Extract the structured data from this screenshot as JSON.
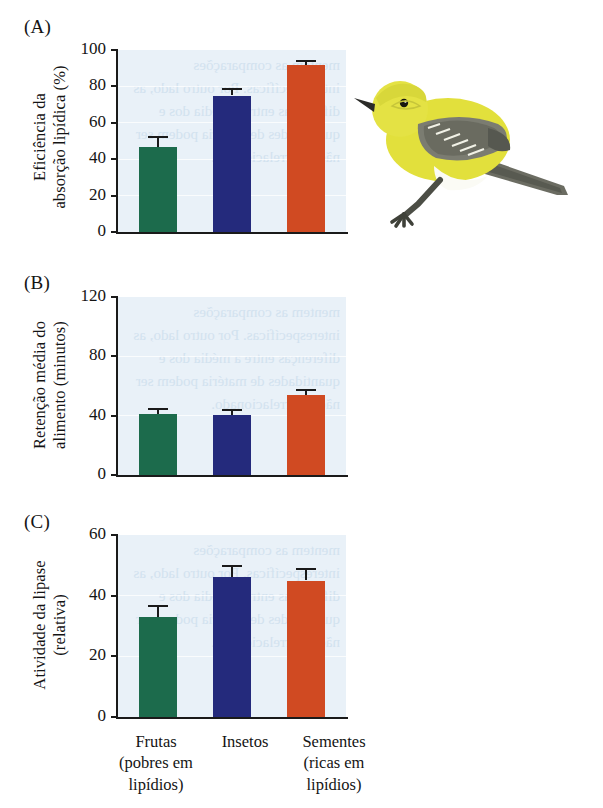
{
  "figure": {
    "panels": [
      {
        "letter": "(A)",
        "ylabel": "Eficiência da\nabsorção lipídica (%)",
        "yticks": [
          "0",
          "20",
          "40",
          "60",
          "80",
          "100"
        ],
        "ymax": 100
      },
      {
        "letter": "(B)",
        "ylabel": "Retenção média do\nalimento (minutos)",
        "yticks": [
          "0",
          "40",
          "80",
          "120"
        ],
        "ymax": 120
      },
      {
        "letter": "(C)",
        "ylabel": "Atividade da lipase\n(relativa)",
        "yticks": [
          "0",
          "20",
          "40",
          "60"
        ],
        "ymax": 60
      }
    ],
    "categories": [
      "Frutas\n(pobres em\nlipídios)",
      "Insetos",
      "Sementes\n(ricas em\nlipídios)"
    ],
    "colors": {
      "green": "#1c6b4c",
      "blue": "#242a7c",
      "orange": "#d04a22",
      "plot_background": "#e9f1f8",
      "axis": "#1a1a1a"
    },
    "illustration": {
      "name": "yellow-warbler-bird",
      "body_color": "#e4e23a",
      "wing_color": "#6f7066",
      "belly_color": "#fbfbf6",
      "beak_color": "#2b2b28"
    },
    "showthrough_text": "mentem as comparações interespecíficas. Por outro lado, as diferenças entre a média dos e quantidades de matéria podem ser não é correlacionado."
  },
  "chart_data": [
    {
      "type": "bar",
      "title": "(A)",
      "categories": [
        "Frutas (pobres em lipídios)",
        "Insetos",
        "Sementes (ricas em lipídios)"
      ],
      "values": [
        46.5,
        75,
        91.5
      ],
      "errors": [
        6,
        4,
        3
      ],
      "xlabel": "",
      "ylabel": "Eficiência da absorção lipídica (%)",
      "ylim": [
        0,
        100
      ],
      "yticks": [
        0,
        20,
        40,
        60,
        80,
        100
      ],
      "grid": true,
      "legend": "none"
    },
    {
      "type": "bar",
      "title": "(B)",
      "categories": [
        "Frutas (pobres em lipídios)",
        "Insetos",
        "Sementes (ricas em lipídios)"
      ],
      "values": [
        41,
        40.5,
        54
      ],
      "errors": [
        4,
        4,
        4
      ],
      "xlabel": "",
      "ylabel": "Retenção média do alimento (minutos)",
      "ylim": [
        0,
        120
      ],
      "yticks": [
        0,
        40,
        80,
        120
      ],
      "grid": true,
      "legend": "none"
    },
    {
      "type": "bar",
      "title": "(C)",
      "categories": [
        "Frutas (pobres em lipídios)",
        "Insetos",
        "Sementes (ricas em lipídios)"
      ],
      "values": [
        33,
        46,
        45
      ],
      "errors": [
        4,
        4,
        4
      ],
      "xlabel": "",
      "ylabel": "Atividade da lipase (relativa)",
      "ylim": [
        0,
        60
      ],
      "yticks": [
        0,
        20,
        40,
        60
      ],
      "grid": true,
      "legend": "none"
    }
  ]
}
